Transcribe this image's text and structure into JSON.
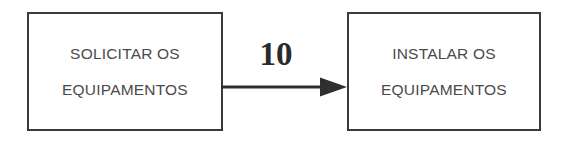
{
  "diagram": {
    "type": "precedence-activity-diagram",
    "background_color": "#ffffff",
    "stroke_color": "#3a3a3a",
    "text_color": "#4a4a4a",
    "label_color": "#2b2b2b",
    "nodes": [
      {
        "id": "solicitar",
        "lines": [
          "SOLICITAR OS",
          "EQUIPAMENTOS"
        ]
      },
      {
        "id": "instalar",
        "lines": [
          "INSTALAR OS",
          "EQUIPAMENTOS"
        ]
      }
    ],
    "edges": [
      {
        "from": "solicitar",
        "to": "instalar",
        "label": "10",
        "arrowhead": "solid-triangle",
        "direction": "left-to-right"
      }
    ]
  }
}
